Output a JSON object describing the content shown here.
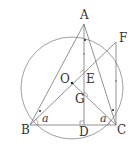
{
  "diagram": {
    "colors": {
      "line": "#777777",
      "text": "#333333",
      "background": "#ffffff"
    },
    "circle": {
      "center": "O",
      "cx": 72,
      "cy": 88,
      "r": 51
    },
    "points": {
      "A": {
        "x": 84,
        "y": 24,
        "label": "A",
        "lx": 80,
        "ly": 19
      },
      "F": {
        "x": 116,
        "y": 42,
        "label": "F",
        "lx": 119,
        "ly": 42
      },
      "O": {
        "x": 72,
        "y": 83,
        "label": "O",
        "lx": 60,
        "ly": 83
      },
      "E": {
        "x": 84,
        "y": 75,
        "label": "E",
        "lx": 86,
        "ly": 83
      },
      "G": {
        "x": 84,
        "y": 98,
        "label": "G",
        "lx": 75,
        "ly": 103
      },
      "B": {
        "x": 30,
        "y": 125,
        "label": "B",
        "lx": 21,
        "ly": 134
      },
      "D": {
        "x": 84,
        "y": 125,
        "label": "D",
        "lx": 79,
        "ly": 136
      },
      "C": {
        "x": 116,
        "y": 125,
        "label": "C",
        "lx": 117,
        "ly": 134
      }
    },
    "segments": [
      [
        "A",
        "B"
      ],
      [
        "A",
        "C"
      ],
      [
        "A",
        "D"
      ],
      [
        "B",
        "F"
      ],
      [
        "B",
        "C"
      ],
      [
        "F",
        "C"
      ],
      [
        "O",
        "C"
      ]
    ],
    "angle_labels": [
      {
        "text": "a",
        "x": 42,
        "y": 122,
        "at": "B"
      },
      {
        "text": "a",
        "x": 100,
        "y": 122,
        "at": "C"
      }
    ],
    "right_angle": {
      "at": "D"
    },
    "marks": [
      "equal-segment dots on AE",
      "equal-segment dots on FC",
      "equal-angle dots at B and C"
    ]
  }
}
